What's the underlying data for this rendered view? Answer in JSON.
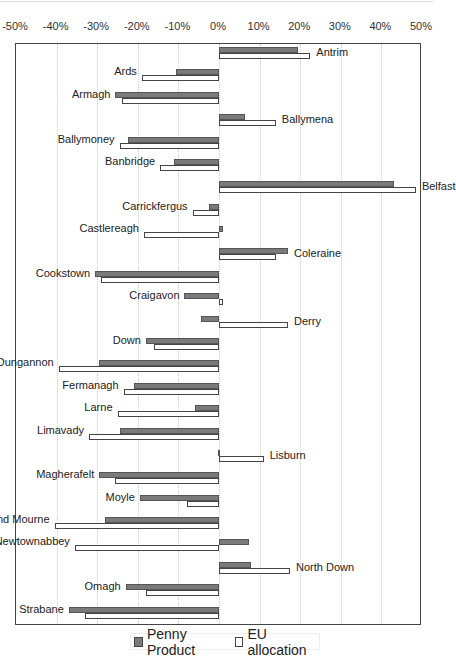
{
  "chart_data": {
    "type": "bar",
    "orientation": "horizontal",
    "title": "",
    "xlabel": "",
    "ylabel": "",
    "xlim": [
      -50,
      50
    ],
    "x_ticks": [
      "-50%",
      "-40%",
      "-30%",
      "-20%",
      "-10%",
      "0%",
      "10%",
      "20%",
      "30%",
      "40%",
      "50%"
    ],
    "grid": true,
    "legend_position": "bottom",
    "categories": [
      "Antrim",
      "Ards",
      "Armagh",
      "Ballymena",
      "Ballymoney",
      "Banbridge",
      "Belfast",
      "Carrickfergus",
      "Castlereagh",
      "Coleraine",
      "Cookstown",
      "Craigavon",
      "Derry",
      "Down",
      "Dungannon",
      "Fermanagh",
      "Larne",
      "Limavady",
      "Lisburn",
      "Magherafelt",
      "Moyle",
      "Newry and Mourne",
      "Newtownabbey",
      "North Down",
      "Omagh",
      "Strabane"
    ],
    "series": [
      {
        "name": "Penny Product",
        "color": "#7a7a7a",
        "values": [
          19.5,
          -10.5,
          -25.5,
          6.5,
          -22.5,
          -11,
          43,
          -2.5,
          1,
          17,
          -30.5,
          -8.5,
          -4.5,
          -18,
          -29.5,
          -21,
          -6,
          -24.5,
          -0.3,
          -29.5,
          -19.5,
          -28,
          7.5,
          7.8,
          -23,
          -37
        ]
      },
      {
        "name": "EU allocation",
        "color": "#ffffff",
        "values": [
          22.5,
          -19,
          -24,
          14,
          -24.5,
          -14.5,
          48.5,
          -6.5,
          -18.5,
          14,
          -29,
          1,
          17,
          -16,
          -39.5,
          -23.5,
          -25,
          -32,
          11,
          -25.5,
          -8,
          -40.5,
          -35.5,
          17.5,
          -18,
          -33
        ]
      }
    ]
  },
  "labels": {
    "legend_pp": "Penny Product",
    "legend_eu": "EU allocation"
  }
}
